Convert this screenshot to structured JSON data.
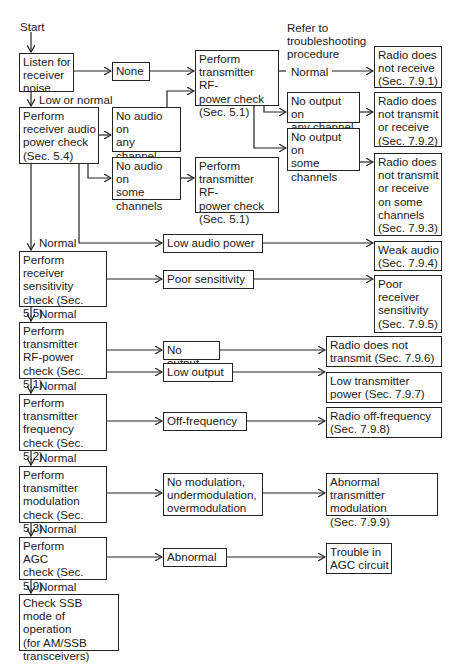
{
  "diagram": {
    "type": "flowchart",
    "start_label": "Start",
    "refer_label": "Refer to\ntroubleshooting\nprocedure",
    "edge_labels": {
      "low_or_normal": "Low or normal",
      "normal": "Normal"
    },
    "checks": [
      {
        "id": "listen",
        "text": "Listen for\nreceiver\nnoise"
      },
      {
        "id": "rx_audio",
        "text": "Perform\nreceiver audio\npower check\n(Sec. 5.4)"
      },
      {
        "id": "rx_sens",
        "text": "Perform\nreceiver\nsensitivity\ncheck (Sec. 5.5)"
      },
      {
        "id": "tx_rf",
        "text": "Perform\ntransmitter\nRF-power\ncheck (Sec. 5.1)"
      },
      {
        "id": "tx_freq",
        "text": "Perform\ntransmitter\nfrequency\ncheck (Sec. 5.2)"
      },
      {
        "id": "tx_mod",
        "text": "Perform\ntransmitter\nmodulation\ncheck (Sec. 5.3)"
      },
      {
        "id": "agc",
        "text": "Perform\nAGC\ncheck (Sec. 5.9)"
      },
      {
        "id": "ssb",
        "text": "Check SSB\nmode of operation\n(for AM/SSB\ntransceivers)"
      }
    ],
    "conditions": {
      "none": "None",
      "no_audio_any": "No audio on\nany channel\n(noise only)",
      "no_audio_some": "No audio on\nsome\nchannels",
      "low_audio": "Low audio power",
      "poor_sens": "Poor sensitivity",
      "no_output": "No output",
      "low_output": "Low output",
      "off_freq": "Off-frequency",
      "bad_mod": "No modulation,\nundermodulation,\novermodulation",
      "abnormal": "Abnormal",
      "tx_rf_check_top": "Perform\ntransmitter RF-\npower check\n(Sec. 5.1)",
      "tx_rf_check_mid": "Perform\ntransmitter RF-\npower check\n(Sec. 5.1)",
      "normal_out": "Normal",
      "no_out_any": "No output on\nany channel",
      "no_out_some": "No output on\nsome\nchannels"
    },
    "outcomes": {
      "r791": "Radio does\nnot receive\n(Sec. 7.9.1)",
      "r792": "Radio does\nnot transmit\nor receive\n(Sec. 7.9.2)",
      "r793": "Radio does\nnot transmit\nor receive\non some\nchannels\n(Sec. 7.9.3)",
      "r794": "Weak audio\n(Sec. 7.9.4)",
      "r795": "Poor\nreceiver\nsensitivity\n(Sec. 7.9.5)",
      "r796": "Radio does not\ntransmit (Sec. 7.9.6)",
      "r797": "Low transmitter\npower (Sec. 7.9.7)",
      "r798": "Radio off-frequency\n(Sec. 7.9.8)",
      "r799": "Abnormal transmitter\nmodulation\n(Sec. 7.9.9)",
      "agc_trouble": "Trouble in\nAGC circuit"
    }
  }
}
